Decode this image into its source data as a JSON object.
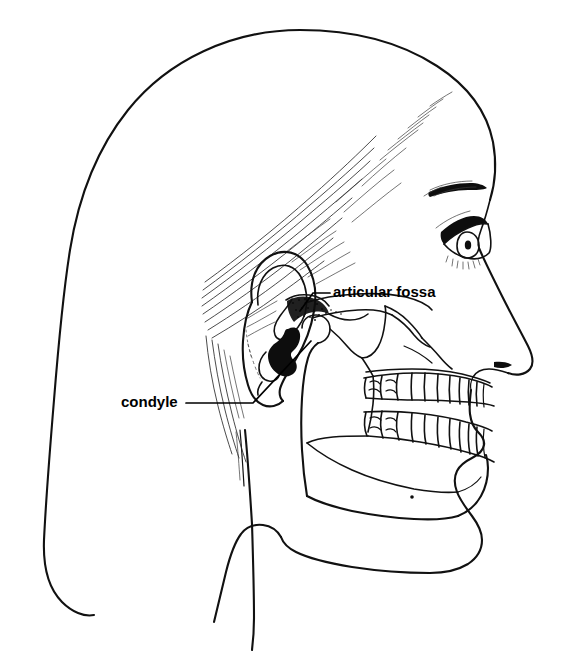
{
  "figure": {
    "kind": "anatomical-line-drawing",
    "view": "right lateral profile, facing right",
    "canvas": {
      "width": 569,
      "height": 654
    },
    "background_color": "#ffffff",
    "ink_color": "#111111",
    "label_color": "#000000",
    "style": "black-and-white pen-and-ink line art, no shading except stippled fossa"
  },
  "labels": [
    {
      "id": "articular-fossa",
      "text": "articular fossa",
      "text_x": 333,
      "text_y": 293,
      "anchor": "start",
      "leader_path": "M 330 293 L 313 293 L 300 311",
      "target_x": 300,
      "target_y": 311,
      "target_structure": "stippled concavity of the temporal bone (mandibular fossa)"
    },
    {
      "id": "condyle",
      "text": "condyle",
      "text_x": 121,
      "text_y": 403,
      "anchor": "start",
      "leader_path": "M 186 403 L 253 403 L 311 341",
      "target_x": 311,
      "target_y": 341,
      "target_structure": "rounded head of the mandibular condyle"
    }
  ],
  "structures": [
    {
      "name": "cranium-outline",
      "visible": true
    },
    {
      "name": "forehead-and-face-profile",
      "visible": true
    },
    {
      "name": "nose-profile",
      "visible": true
    },
    {
      "name": "lips-profile",
      "visible": true
    },
    {
      "name": "chin-profile",
      "visible": true
    },
    {
      "name": "neck-outline",
      "visible": true
    },
    {
      "name": "eye",
      "visible": true
    },
    {
      "name": "eyebrow",
      "visible": true
    },
    {
      "name": "ear",
      "visible": true
    },
    {
      "name": "hair-strands",
      "visible": true
    },
    {
      "name": "zygomatic-arch",
      "visible": true
    },
    {
      "name": "maxilla",
      "visible": true
    },
    {
      "name": "mandible-ramus",
      "visible": true
    },
    {
      "name": "mandible-body",
      "visible": true
    },
    {
      "name": "coronoid-process",
      "visible": true
    },
    {
      "name": "mandibular-notch",
      "visible": true
    },
    {
      "name": "condyle",
      "visible": true
    },
    {
      "name": "articular-fossa",
      "visible": true
    },
    {
      "name": "upper-teeth-row",
      "visible": true
    },
    {
      "name": "lower-teeth-row",
      "visible": true
    },
    {
      "name": "mental-foramen-dot",
      "visible": true
    }
  ],
  "teeth": {
    "upper_count": 8,
    "lower_count": 8,
    "description": "molars at the posterior narrowing to incisors at the anterior"
  }
}
